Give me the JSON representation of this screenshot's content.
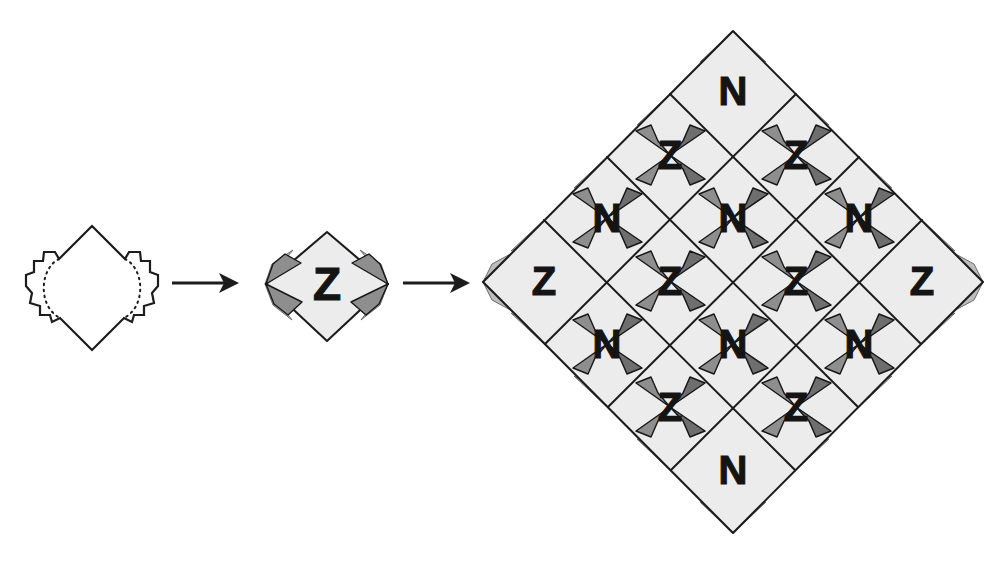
{
  "figure": {
    "background_color": "#ffffff",
    "width": 1007,
    "height": 565
  },
  "palette": {
    "tile_fill": "#ececec",
    "outline": "#1c1c1c",
    "flap_dark": "#6e6e6e",
    "flap_mid": "#8e8e8e",
    "flap_light": "#bdbdbd",
    "paper_white": "#ffffff",
    "glyph_color": "#141414"
  },
  "stages": [
    {
      "id": "stage-blob",
      "name": "blob-template",
      "label": "",
      "description": "Irregular diamond blob with stepped bulging left and right sides and dotted fold arcs",
      "center": {
        "x": 92,
        "y": 288
      },
      "has_dotted_fold_lines": true,
      "letter": ""
    },
    {
      "id": "stage-single-tile",
      "name": "single-tile",
      "label": "",
      "description": "Single folded diamond tile with gray corner flaps at left and right vertices",
      "center": {
        "x": 326,
        "y": 287
      },
      "letter": "Z",
      "flap_count": 4
    },
    {
      "id": "stage-tiling",
      "name": "tiling-grid",
      "label": "",
      "description": "Sixteen tiles assembled into a large diamond, letters alternating Z and N",
      "center": {
        "x": 733,
        "y": 281
      },
      "rows": 4,
      "cols": 4,
      "tile_count": 16,
      "letters_by_diagonal_row": [
        [
          "N"
        ],
        [
          "Z",
          "Z"
        ],
        [
          "N",
          "N",
          "N"
        ],
        [
          "Z",
          "Z",
          "Z",
          "Z"
        ],
        [
          "N",
          "N",
          "N"
        ],
        [
          "Z",
          "Z"
        ],
        [
          "N"
        ]
      ],
      "letters_grid": [
        [
          "N",
          "Z",
          "N",
          "Z"
        ],
        [
          "Z",
          "N",
          "Z",
          "N"
        ],
        [
          "N",
          "Z",
          "N",
          "Z"
        ],
        [
          "Z",
          "N",
          "Z",
          "N"
        ]
      ]
    }
  ],
  "arrows": [
    {
      "id": "arrow-1",
      "name": "arrow-blob-to-tile",
      "from": "stage-blob",
      "to": "stage-single-tile",
      "x1": 172,
      "x2": 238,
      "y": 283
    },
    {
      "id": "arrow-2",
      "name": "arrow-tile-to-tiling",
      "from": "stage-single-tile",
      "to": "stage-tiling",
      "x1": 403,
      "x2": 469,
      "y": 283
    }
  ],
  "glyphs": {
    "z": "Z",
    "n": "N"
  },
  "tiling_letters": [
    {
      "letter": "N",
      "x": 733,
      "y": 91
    },
    {
      "letter": "Z",
      "x": 670,
      "y": 155
    },
    {
      "letter": "Z",
      "x": 796,
      "y": 155
    },
    {
      "letter": "N",
      "x": 607,
      "y": 218
    },
    {
      "letter": "N",
      "x": 733,
      "y": 218
    },
    {
      "letter": "N",
      "x": 859,
      "y": 218
    },
    {
      "letter": "Z",
      "x": 544,
      "y": 281
    },
    {
      "letter": "Z",
      "x": 670,
      "y": 281
    },
    {
      "letter": "Z",
      "x": 796,
      "y": 281
    },
    {
      "letter": "Z",
      "x": 922,
      "y": 281
    },
    {
      "letter": "N",
      "x": 607,
      "y": 344
    },
    {
      "letter": "N",
      "x": 733,
      "y": 344
    },
    {
      "letter": "N",
      "x": 859,
      "y": 344
    },
    {
      "letter": "Z",
      "x": 670,
      "y": 407
    },
    {
      "letter": "Z",
      "x": 796,
      "y": 407
    },
    {
      "letter": "N",
      "x": 733,
      "y": 470
    }
  ],
  "single_tile_letter": {
    "letter": "Z",
    "x": 327,
    "y": 284
  }
}
